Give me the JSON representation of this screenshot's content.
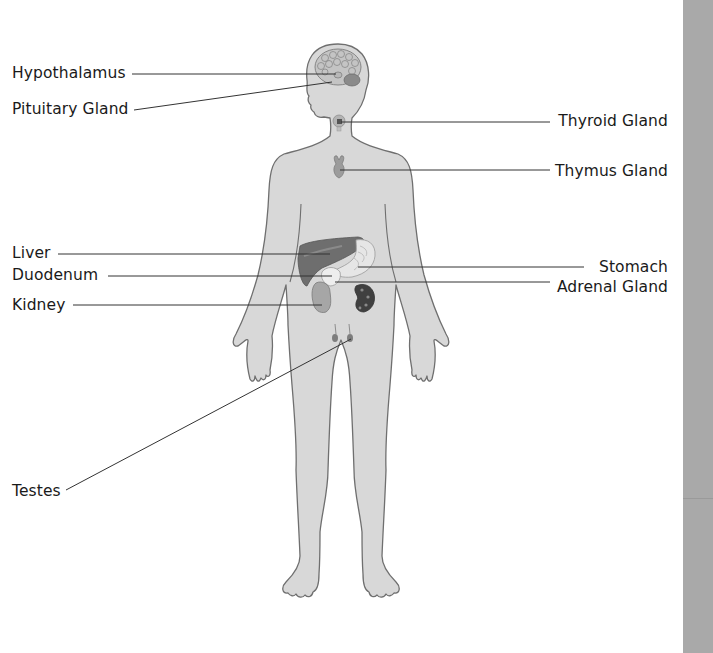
{
  "diagram": {
    "figure": "human-body-silhouette",
    "colors": {
      "body_fill": "#d8d8d8",
      "body_outline": "#6f6f6f",
      "leader_line": "#333333",
      "sidebar": "#a9a9a9",
      "background": "#ffffff"
    },
    "labels_left": [
      {
        "id": "hypothalamus",
        "text": "Hypothalamus",
        "x": 12,
        "y": 64
      },
      {
        "id": "pituitary",
        "text": "Pituitary Gland",
        "x": 12,
        "y": 100
      },
      {
        "id": "liver",
        "text": "Liver",
        "x": 12,
        "y": 244
      },
      {
        "id": "duodenum",
        "text": "Duodenum",
        "x": 12,
        "y": 266
      },
      {
        "id": "kidney",
        "text": "Kidney",
        "x": 12,
        "y": 296
      },
      {
        "id": "testes",
        "text": "Testes",
        "x": 12,
        "y": 483
      }
    ],
    "labels_right": [
      {
        "id": "thyroid",
        "text": "Thyroid Gland",
        "right": 45,
        "y": 112
      },
      {
        "id": "thymus",
        "text": "Thymus Gland",
        "right": 45,
        "y": 162
      },
      {
        "id": "stomach",
        "text": "Stomach",
        "right": 45,
        "y": 259
      },
      {
        "id": "adrenal",
        "text": "Adrenal Gland",
        "right": 45,
        "y": 279
      }
    ]
  }
}
